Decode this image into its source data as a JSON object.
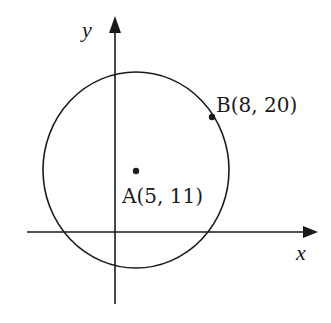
{
  "diagram": {
    "type": "coordinate-geometry",
    "axes": {
      "x_label": "x",
      "y_label": "y"
    },
    "circle": {
      "center_label": "A",
      "center": "A(5, 11)",
      "point_on_circle": "B(8, 20)"
    },
    "points": [
      {
        "name": "A",
        "label": "A(5, 11)",
        "x": 5,
        "y": 11
      },
      {
        "name": "B",
        "label": "B(8, 20)",
        "x": 8,
        "y": 20
      }
    ],
    "colors": {
      "stroke": "#1a1a1a",
      "background": "#ffffff"
    }
  }
}
